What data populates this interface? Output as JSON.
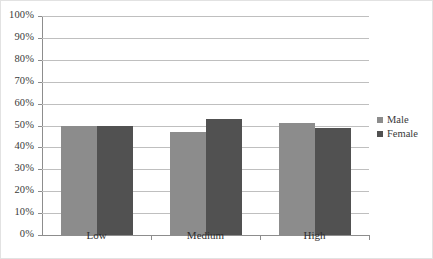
{
  "chart_data": {
    "type": "bar",
    "title": "",
    "subtitle": "",
    "xlabel": "",
    "ylabel": "",
    "categories": [
      "Low",
      "Medium",
      "High"
    ],
    "series": [
      {
        "name": "Male",
        "color": "#8c8c8c",
        "values": [
          50,
          47,
          51
        ]
      },
      {
        "name": "Female",
        "color": "#515151",
        "values": [
          50,
          53,
          49
        ]
      }
    ],
    "ylim": [
      0,
      100
    ],
    "ytick_step": 10,
    "ytick_labels": [
      "100%",
      "90%",
      "80%",
      "70%",
      "60%",
      "50%",
      "40%",
      "30%",
      "20%",
      "10%",
      "0%"
    ],
    "ytick_values": [
      100,
      90,
      80,
      70,
      60,
      50,
      40,
      30,
      20,
      10,
      0
    ],
    "value_suffix": "%",
    "grid": true,
    "grid_axis": "y",
    "legend_position": "right",
    "legend_entries": [
      "Male",
      "Female"
    ],
    "axis_color": "#8d8d8d",
    "grid_color": "#bfbfbf",
    "background": "#ffffff",
    "border_color": "#e2e2e2"
  }
}
